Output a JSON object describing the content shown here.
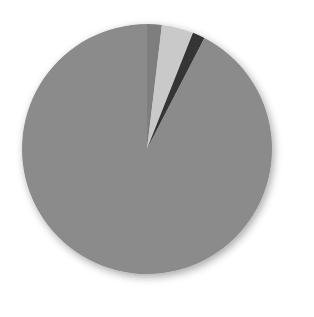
{
  "chart_data": {
    "type": "pie",
    "title": "",
    "start_angle_deg": 0,
    "direction": "clockwise",
    "slices": [
      {
        "label": "",
        "value": 1.9,
        "color": "#7e7e7e"
      },
      {
        "label": "",
        "value": 4.1,
        "color": "#c9c9c9"
      },
      {
        "label": "",
        "value": 1.6,
        "color": "#343434"
      },
      {
        "label": "",
        "value": 92.4,
        "color": "#8b8b8b"
      }
    ],
    "values": [
      1.9,
      4.1,
      1.6,
      92.4
    ],
    "legend": [],
    "data_labels": []
  },
  "layout": {
    "center": [
      147,
      149
    ],
    "radius": 125,
    "shadow": true
  }
}
